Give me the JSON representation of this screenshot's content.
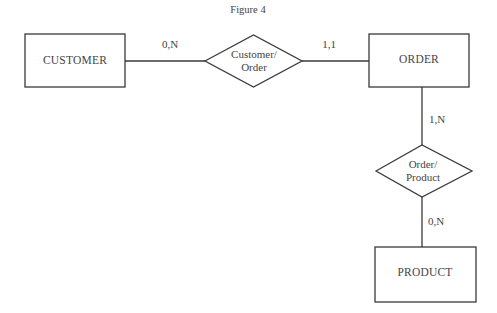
{
  "title": "Figure 4",
  "entities": [
    {
      "id": "customer",
      "label": "CUSTOMER"
    },
    {
      "id": "order",
      "label": "ORDER"
    },
    {
      "id": "product",
      "label": "PRODUCT"
    }
  ],
  "relationships": [
    {
      "id": "customer_order",
      "line1": "Customer/",
      "line2": "Order"
    },
    {
      "id": "order_product",
      "line1": "Order/",
      "line2": "Product"
    }
  ],
  "cardinalities": {
    "customer_side": "0,N",
    "order_side_top": "1,1",
    "order_side_bottom": "1,N",
    "product_side": "0,N"
  }
}
